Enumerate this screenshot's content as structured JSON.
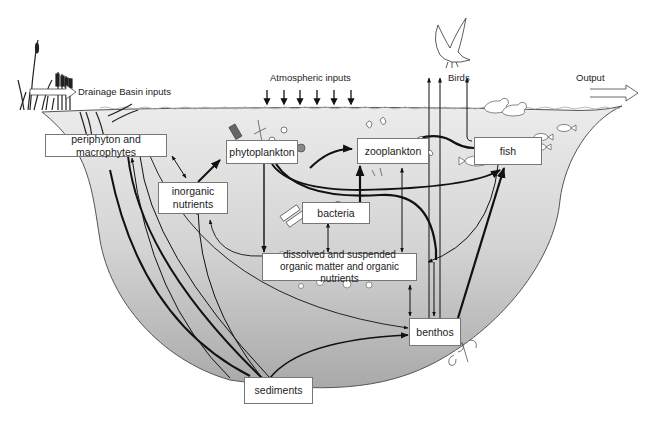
{
  "external_labels": {
    "drainage": "Drainage Basin inputs",
    "atmospheric": "Atmospheric inputs",
    "birds": "Birds",
    "output": "Output"
  },
  "nodes": {
    "periphyton": "periphyton and macrophytes",
    "phytoplankton": "phytoplankton",
    "zooplankton": "zooplankton",
    "fish": "fish",
    "inorganic_line1": "inorganic",
    "inorganic_line2": "nutrients",
    "bacteria": "bacteria",
    "dom_line1": "dissolved and suspended",
    "dom_line2": "organic matter and organic nutrients",
    "benthos": "benthos",
    "sediments": "sediments"
  },
  "colors": {
    "water_top": "#e6e6e6",
    "water_bottom": "#a8a8a8",
    "box_fill": "#ffffff",
    "box_border": "#777777",
    "arrow": "#111111"
  },
  "icons": [
    "cattail-reeds-icon",
    "eagle-icon",
    "ducks-icon",
    "fish-school-icon",
    "plankton-icon",
    "bacteria-icon",
    "benthos-invertebrate-icon",
    "particle-bubbles-icon"
  ]
}
